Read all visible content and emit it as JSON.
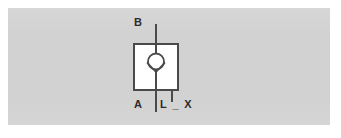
{
  "image": {
    "kind": "engineering-schematic",
    "subject": "hydraulic check valve symbol",
    "width": 341,
    "height": 138
  },
  "colors": {
    "page_background": "#ffffff",
    "panel_background": "#d2d2d2",
    "line_stroke": "#4a4a4a",
    "label_text": "#2b2b2b",
    "box_fill": "#ffffff"
  },
  "panel": {
    "x": 8,
    "y": 8,
    "width": 322,
    "height": 117
  },
  "symbol": {
    "name": "check-valve",
    "box": {
      "x": 134,
      "y": 44,
      "width": 44,
      "height": 46
    },
    "circle": {
      "cx": 156,
      "cy": 62,
      "r": 8
    },
    "flow_line": {
      "x": 156,
      "y_top": 24,
      "y_bottom": 112
    },
    "drain_stub": {
      "x": 172,
      "y_top": 90,
      "y_bottom": 102
    }
  },
  "labels": {
    "port_b": "B",
    "port_a": "A",
    "drain": "L _ X"
  },
  "legend": {
    "port_b_desc": "B",
    "port_a_desc": "A",
    "drain_desc": "L _ X"
  }
}
